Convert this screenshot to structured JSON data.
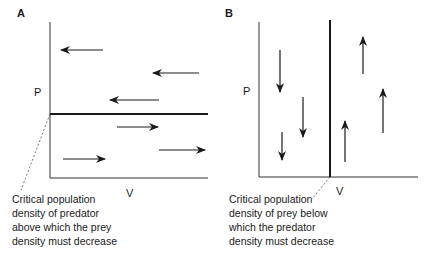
{
  "panel_a": {
    "label": "A",
    "y_axis_label": "P",
    "x_axis_label": "V",
    "threshold": "horizontal",
    "arrows_above_direction": "left",
    "arrows_below_direction": "right",
    "annotation": [
      "Critical population",
      "density of predator",
      "above which the prey",
      "density must decrease"
    ]
  },
  "panel_b": {
    "label": "B",
    "y_axis_label": "P",
    "x_axis_label": "V",
    "threshold": "vertical",
    "arrows_left_direction": "down",
    "arrows_right_direction": "up",
    "annotation": [
      "Critical population",
      "density of prey below",
      "which the predator",
      "density must decrease"
    ]
  },
  "colors": {
    "ink": "#1a1a1a"
  }
}
